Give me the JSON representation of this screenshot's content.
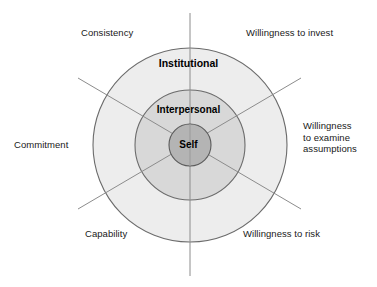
{
  "diagram": {
    "type": "concentric-circles",
    "center": {
      "x": 190,
      "y": 145
    },
    "rings": [
      {
        "key": "institutional",
        "label": "Institutional",
        "radius": 97,
        "fill": "#ededed",
        "stroke": "#6b6b6b"
      },
      {
        "key": "interpersonal",
        "label": "Interpersonal",
        "radius": 55,
        "fill": "#d8d8d8",
        "stroke": "#6b6b6b"
      },
      {
        "key": "self",
        "label": "Self",
        "radius": 21,
        "fill": "#b4b4b4",
        "stroke": "#5a5a5a"
      }
    ],
    "axes": [
      {
        "key": "vertical",
        "x1": 190,
        "y1": 13,
        "x2": 190,
        "y2": 276
      },
      {
        "key": "diagonal-down",
        "x1": 78,
        "y1": 78,
        "x2": 301,
        "y2": 209
      },
      {
        "key": "diagonal-up",
        "x1": 78,
        "y1": 209,
        "x2": 301,
        "y2": 78
      }
    ],
    "axis_stroke": "#8c8c8c",
    "outer_labels": [
      {
        "key": "consistency",
        "text": "Consistency"
      },
      {
        "key": "invest",
        "text": "Willingness to invest"
      },
      {
        "key": "examine",
        "text": "Willingness\nto examine\nassumptions"
      },
      {
        "key": "commitment",
        "text": "Commitment"
      },
      {
        "key": "capability",
        "text": "Capability"
      },
      {
        "key": "risk",
        "text": "Willingness to risk"
      }
    ]
  }
}
